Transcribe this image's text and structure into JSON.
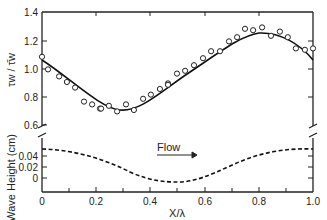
{
  "chart_data": [
    {
      "panel": "upper",
      "type": "scatter",
      "title": "",
      "xlabel": "X/λ",
      "ylabel": "τw / τ̄w",
      "xlim": [
        0,
        1.0
      ],
      "ylim": [
        0.55,
        1.4
      ],
      "grid": false,
      "y_ticks": [
        "0.6",
        "0.8",
        "1.0",
        "1.2",
        "1.4"
      ],
      "y_tick_values": [
        0.6,
        0.8,
        1.0,
        1.2,
        1.4
      ],
      "series": [
        {
          "name": "measured",
          "marker": "open-circle",
          "x": [
            0.0,
            0.022,
            0.063,
            0.092,
            0.122,
            0.155,
            0.185,
            0.214,
            0.218,
            0.247,
            0.277,
            0.31,
            0.339,
            0.373,
            0.402,
            0.435,
            0.465,
            0.465,
            0.498,
            0.528,
            0.561,
            0.594,
            0.624,
            0.657,
            0.69,
            0.72,
            0.749,
            0.779,
            0.812,
            0.845,
            0.878,
            0.907,
            0.937,
            0.97,
            1.0
          ],
          "y": [
            1.08,
            0.99,
            0.94,
            0.9,
            0.86,
            0.76,
            0.74,
            0.71,
            0.71,
            0.73,
            0.69,
            0.74,
            0.7,
            0.78,
            0.81,
            0.85,
            0.89,
            0.88,
            0.96,
            0.98,
            1.02,
            1.07,
            1.12,
            1.12,
            1.19,
            1.22,
            1.28,
            1.27,
            1.29,
            1.23,
            1.26,
            1.22,
            1.14,
            1.13,
            1.14
          ]
        },
        {
          "name": "fit",
          "style": "solid-line",
          "x": [
            0.0,
            0.1,
            0.2,
            0.3,
            0.4,
            0.5,
            0.6,
            0.7,
            0.8,
            0.9,
            1.0
          ],
          "y": [
            1.06,
            0.92,
            0.79,
            0.72,
            0.76,
            0.9,
            1.07,
            1.21,
            1.28,
            1.23,
            1.06
          ]
        }
      ]
    },
    {
      "panel": "lower",
      "type": "line",
      "xlabel": "X/λ",
      "ylabel": "Wave Height (cm)",
      "xlim": [
        0,
        1.0
      ],
      "ylim": [
        -0.02,
        0.06
      ],
      "grid": false,
      "x_ticks": [
        "0",
        "0.2",
        "0.4",
        "0.6",
        "0.8",
        "1.0"
      ],
      "x_tick_values": [
        0,
        0.2,
        0.4,
        0.6,
        0.8,
        1.0
      ],
      "y_ticks": [
        "0",
        "0.02",
        "0.04"
      ],
      "y_tick_values": [
        0,
        0.02,
        0.04
      ],
      "annotations": [
        {
          "text": "Flow",
          "arrow": "right",
          "x": 0.48,
          "y": 0.05
        }
      ],
      "series": [
        {
          "name": "wave surface",
          "style": "dashed-line",
          "x": [
            0.0,
            0.1,
            0.2,
            0.3,
            0.4,
            0.5,
            0.6,
            0.7,
            0.8,
            0.9,
            1.0
          ],
          "y": [
            0.053,
            0.049,
            0.038,
            0.022,
            0.004,
            -0.007,
            0.004,
            0.022,
            0.038,
            0.049,
            0.053
          ]
        }
      ]
    }
  ],
  "labels": {
    "y_upper": "τw / τ̄w",
    "y_lower": "Wave Height (cm)",
    "x": "X/λ",
    "flow": "Flow",
    "xt0": "0",
    "xt1": "0.2",
    "xt2": "0.4",
    "xt3": "0.6",
    "xt4": "0.8",
    "xt5": "1.0",
    "yu0": "1.4",
    "yu1": "1.2",
    "yu2": "1.0",
    "yu3": "0.8",
    "yu4": "0.6",
    "yl0": "0.04",
    "yl1": "0.02",
    "yl2": "0"
  }
}
